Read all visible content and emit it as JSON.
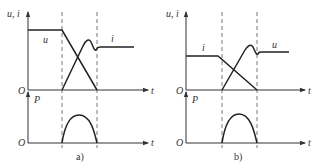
{
  "panels": [
    {
      "id": "a",
      "caption": "a)",
      "upper": {
        "y_label": "u, i",
        "x_label": "t",
        "origin_label": "O",
        "curves": [
          {
            "name": "u",
            "label": "u",
            "description": "constant high, then falls linearly to zero between switching instants"
          },
          {
            "name": "i",
            "label": "i",
            "description": "zero, rises linearly, overshoots with small oscillation, settles to steady level"
          }
        ]
      },
      "lower": {
        "y_label": "P",
        "x_label": "t",
        "origin_label": "O",
        "curve": "power loss arch during transition"
      }
    },
    {
      "id": "b",
      "caption": "b)",
      "upper": {
        "y_label": "u, i",
        "x_label": "t",
        "origin_label": "O",
        "curves": [
          {
            "name": "i",
            "label": "i",
            "description": "constant, then falls linearly to zero"
          },
          {
            "name": "u",
            "label": "u",
            "description": "zero, rises linearly, overshoots with small oscillation, settles to steady level"
          }
        ]
      },
      "lower": {
        "y_label": "P",
        "x_label": "t",
        "origin_label": "O",
        "curve": "power loss arch during transition"
      }
    }
  ]
}
